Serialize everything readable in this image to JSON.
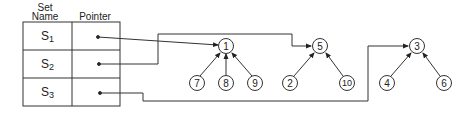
{
  "table": {
    "headers": {
      "set_name": [
        "Set",
        "Name"
      ],
      "pointer": "Pointer"
    },
    "rows": [
      {
        "set": "S",
        "sub": "1"
      },
      {
        "set": "S",
        "sub": "2"
      },
      {
        "set": "S",
        "sub": "3"
      }
    ]
  },
  "trees": [
    {
      "root": "1",
      "children": [
        "7",
        "8",
        "9"
      ]
    },
    {
      "root": "5",
      "children": [
        "2",
        "10"
      ]
    },
    {
      "root": "3",
      "children": [
        "4",
        "6"
      ]
    }
  ],
  "nodes": {
    "n1": "1",
    "n7": "7",
    "n8": "8",
    "n9": "9",
    "n5": "5",
    "n2": "2",
    "n10": "10",
    "n3": "3",
    "n4": "4",
    "n6": "6"
  }
}
